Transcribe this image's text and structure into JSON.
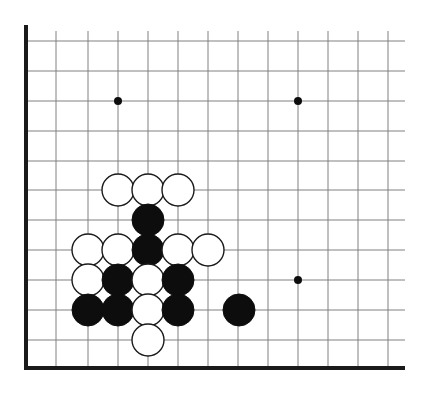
{
  "board": {
    "title": "Go board position diagram",
    "type": "go-goban",
    "board_size": 19,
    "visible_region": "bottom-left corner",
    "background_color": "#ffffff",
    "grid_line_color": "#808080",
    "edge_line_color": "#1a1a1a",
    "black_stone_color": "#0d0d0d",
    "white_stone_color": "#ffffff",
    "white_stone_outline_color": "#1a1a1a",
    "star_point_color": "#0d0d0d",
    "grid_spacing_px": 30,
    "stone_radius_px": 16,
    "star_point_radius_px": 4,
    "origin": {
      "x": 26,
      "y": 31
    },
    "columns_px": [
      26,
      56,
      88,
      118,
      148,
      178,
      208,
      238,
      268,
      298,
      328,
      358,
      388
    ],
    "rows_px": [
      31,
      41,
      71,
      101,
      131,
      161,
      190,
      220,
      250,
      280,
      310,
      340,
      368
    ],
    "left_edge_x": 26,
    "bottom_edge_y": 368,
    "grid_right_x": 405,
    "grid_top_y": 31,
    "edge_line_width": 4,
    "grid_line_width": 1,
    "vertical_lines_x": [
      56,
      88,
      118,
      148,
      178,
      208,
      238,
      268,
      298,
      328,
      358,
      388
    ],
    "horizontal_lines_y": [
      41,
      71,
      101,
      131,
      161,
      190,
      220,
      250,
      280,
      310,
      340
    ],
    "star_points": [
      {
        "name": "hoshi-upper-left",
        "x": 118,
        "y": 101
      },
      {
        "name": "hoshi-upper-right",
        "x": 298,
        "y": 101
      },
      {
        "name": "hoshi-lower-right",
        "x": 298,
        "y": 280
      }
    ],
    "stones": [
      {
        "id": "w1",
        "color": "white",
        "x": 118,
        "y": 190
      },
      {
        "id": "w2",
        "color": "white",
        "x": 148,
        "y": 190
      },
      {
        "id": "w3",
        "color": "white",
        "x": 178,
        "y": 190
      },
      {
        "id": "b1",
        "color": "black",
        "x": 148,
        "y": 220
      },
      {
        "id": "w4",
        "color": "white",
        "x": 88,
        "y": 250
      },
      {
        "id": "w5",
        "color": "white",
        "x": 118,
        "y": 250
      },
      {
        "id": "b2",
        "color": "black",
        "x": 148,
        "y": 250
      },
      {
        "id": "w6",
        "color": "white",
        "x": 178,
        "y": 250
      },
      {
        "id": "w7",
        "color": "white",
        "x": 208,
        "y": 250
      },
      {
        "id": "w8",
        "color": "white",
        "x": 88,
        "y": 280
      },
      {
        "id": "b3",
        "color": "black",
        "x": 118,
        "y": 280
      },
      {
        "id": "w9",
        "color": "white",
        "x": 148,
        "y": 280
      },
      {
        "id": "b4",
        "color": "black",
        "x": 178,
        "y": 280
      },
      {
        "id": "b5",
        "color": "black",
        "x": 88,
        "y": 310
      },
      {
        "id": "b6",
        "color": "black",
        "x": 118,
        "y": 310
      },
      {
        "id": "w10",
        "color": "white",
        "x": 148,
        "y": 310
      },
      {
        "id": "b7",
        "color": "black",
        "x": 178,
        "y": 310
      },
      {
        "id": "b8",
        "color": "black",
        "x": 239,
        "y": 310
      },
      {
        "id": "w11",
        "color": "white",
        "x": 148,
        "y": 340
      }
    ],
    "counts": {
      "black_stones": 8,
      "white_stones": 11,
      "total_stones": 19
    }
  }
}
